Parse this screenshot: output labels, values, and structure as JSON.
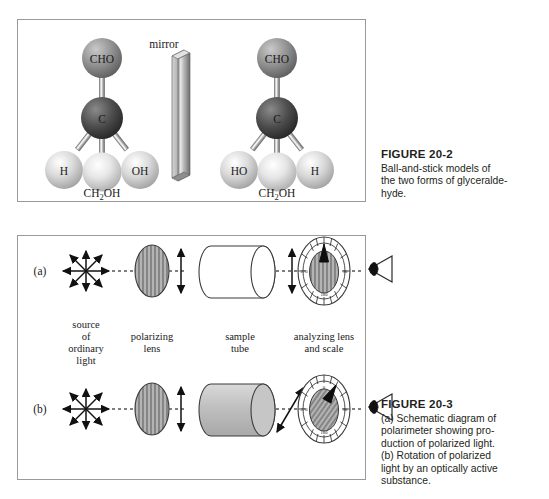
{
  "page": {
    "background": "#ffffff"
  },
  "figure_20_2": {
    "panel_name": "ball-and-stick mirror-image figure",
    "mirror_label": "mirror",
    "molecules": [
      {
        "side": "left",
        "formula_label": "CH2OH",
        "formula_display": "CH₂OH",
        "atoms": {
          "top": "CHO",
          "center": "C",
          "bottom_left": "H",
          "bottom_right": "OH"
        }
      },
      {
        "side": "right",
        "formula_label": "CH2OH",
        "formula_display": "CH₂OH",
        "atoms": {
          "top": "CHO",
          "center": "C",
          "bottom_left": "HO",
          "bottom_right": "H"
        }
      }
    ],
    "caption": {
      "title": "FIGURE 20-2",
      "line1": "Ball-and-stick models of",
      "line2": "the two forms of glyceralde-",
      "line3": "hyde."
    },
    "colors": {
      "carbon_sphere": "#4a4a4a",
      "cho_sphere": "#8c8c8c",
      "light_sphere": "#cfcfcf",
      "mirror_face": "#b9b9b9",
      "panel_border": "#9a9a9a"
    }
  },
  "figure_20_3": {
    "panel_name": "polarimeter schematic figure",
    "rows": [
      {
        "row_label": "(a)",
        "tube_filled": false,
        "tube_fill_color": "#ffffff",
        "analyzer_rotated": false,
        "exit_arrow_orientation": "vertical",
        "pointer_angle_deg": 0
      },
      {
        "row_label": "(b)",
        "tube_filled": true,
        "tube_fill_color": "#c0c0c0",
        "analyzer_rotated": true,
        "exit_arrow_orientation": "diagonal",
        "pointer_angle_deg": 30
      }
    ],
    "component_labels": [
      {
        "lines": [
          "source",
          "of",
          "ordinary",
          "light"
        ]
      },
      {
        "lines": [
          "polarizing",
          "lens"
        ]
      },
      {
        "lines": [
          "sample",
          "tube"
        ]
      },
      {
        "lines": [
          "analyzing lens",
          "and scale"
        ]
      }
    ],
    "dial_scale": {
      "top": "0",
      "right": "90",
      "bottom": "180",
      "left": "270",
      "tick_count": 24
    },
    "caption": {
      "title": "FIGURE 20-3",
      "line1": "(a) Schematic diagram of",
      "line2": "polarimeter showing pro-",
      "line3": "duction of polarized light.",
      "line4": "(b) Rotation of polarized",
      "line5": "light by an optically active",
      "line6": "substance."
    },
    "colors": {
      "lens_fill": "#b0b0b0",
      "dial_fill": "#b5b5b5",
      "panel_border": "#9a9a9a",
      "ray_line": "#555555"
    }
  }
}
